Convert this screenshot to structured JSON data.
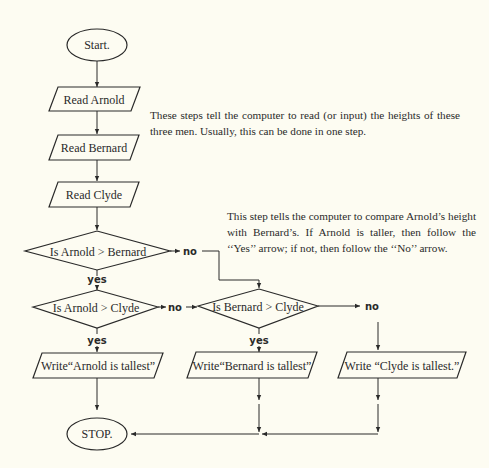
{
  "flowchart": {
    "nodes": {
      "start": {
        "label": "Start.",
        "shape": "terminal"
      },
      "read_arnold": {
        "label": "Read  Arnold",
        "shape": "input"
      },
      "read_bernard": {
        "label": "Read  Bernard",
        "shape": "input"
      },
      "read_clyde": {
        "label": "Read  Clyde",
        "shape": "input"
      },
      "decision_ab": {
        "label": "Is  Arnold > Bernard",
        "shape": "decision"
      },
      "decision_ac": {
        "label": "Is  Arnold > Clyde",
        "shape": "decision"
      },
      "decision_bc": {
        "label": "Is Bernard > Clyde",
        "shape": "decision"
      },
      "write_arnold": {
        "label": "Write“Arnold  is  tallest”",
        "shape": "output"
      },
      "write_bernard": {
        "label": "Write“Bernard is tallest”",
        "shape": "output"
      },
      "write_clyde": {
        "label": "Write “Clyde  is  tallest.”",
        "shape": "output"
      },
      "stop": {
        "label": "STOP.",
        "shape": "terminal"
      }
    },
    "edge_labels": {
      "ab_no": "no",
      "ab_yes": "yes",
      "ac_no": "no",
      "ac_yes": "yes",
      "bc_no": "no",
      "bc_yes": "yes"
    },
    "edges": [
      {
        "from": "start",
        "to": "read_arnold"
      },
      {
        "from": "read_arnold",
        "to": "read_bernard"
      },
      {
        "from": "read_bernard",
        "to": "read_clyde"
      },
      {
        "from": "read_clyde",
        "to": "decision_ab"
      },
      {
        "from": "decision_ab",
        "to": "decision_ac",
        "label": "yes"
      },
      {
        "from": "decision_ab",
        "to": "decision_bc",
        "label": "no"
      },
      {
        "from": "decision_ac",
        "to": "write_arnold",
        "label": "yes"
      },
      {
        "from": "decision_ac",
        "to": "decision_bc",
        "label": "no"
      },
      {
        "from": "decision_bc",
        "to": "write_bernard",
        "label": "yes"
      },
      {
        "from": "decision_bc",
        "to": "write_clyde",
        "label": "no"
      },
      {
        "from": "write_arnold",
        "to": "stop"
      },
      {
        "from": "write_bernard",
        "to": "stop"
      },
      {
        "from": "write_clyde",
        "to": "stop"
      }
    ]
  },
  "annotations": {
    "read_note": "These steps tell the computer to read (or input) the heights of these three men. Usually, this can be done in one step.",
    "compare_note": "This step tells the computer to compare Arnold’s height with Bernard’s. If Arnold is taller, then follow the ‘‘Yes’’ arrow; if not, then follow the ‘‘No’’ arrow."
  }
}
